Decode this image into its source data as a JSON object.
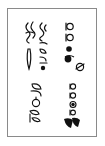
{
  "page": {
    "type": "scanned-figure",
    "orientation": "rotated-90",
    "frame_color": "#8a8a8a",
    "ink_color": "#111111"
  },
  "glyph_groups": [
    {
      "id": "top-left",
      "label": "glyph cluster (hooked strokes with loops)"
    },
    {
      "id": "top-right",
      "label": "glyph cluster (looped p-shapes with filled dots)"
    },
    {
      "id": "bottom-left",
      "label": "glyph cluster (open loops and p-shapes)"
    },
    {
      "id": "bottom-right",
      "label": "glyph cluster (p-shapes with filled flag strokes)"
    }
  ]
}
